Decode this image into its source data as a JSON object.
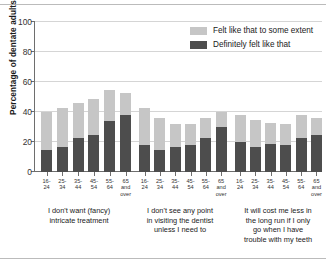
{
  "chart_data": {
    "type": "bar",
    "title": "",
    "subtitle": "",
    "xlabel": "",
    "ylabel": "Percentage of dentate adults",
    "ylim": [
      0,
      100
    ],
    "yticks": [
      0,
      20,
      40,
      60,
      80,
      100
    ],
    "ytick_labels": [
      "0",
      "20",
      "40",
      "60",
      "80",
      "100"
    ],
    "grid": true,
    "stacked": true,
    "legend_position": "top-right",
    "legend": [
      {
        "name": "Felt like that to some extent",
        "color": "#c6c6c6"
      },
      {
        "name": "Definitely felt like that",
        "color": "#4d4d4d"
      }
    ],
    "categories": [
      "16-24",
      "25-34",
      "35-44",
      "45-54",
      "55-64",
      "65 and over"
    ],
    "category_lines": [
      [
        "16-",
        "24"
      ],
      [
        "25-",
        "34"
      ],
      [
        "35-",
        "44"
      ],
      [
        "45-",
        "54"
      ],
      [
        "55-",
        "64"
      ],
      [
        "65",
        "and",
        "over"
      ]
    ],
    "groups": [
      {
        "label": "I don't want (fancy) intricate treatment",
        "label_lines": [
          "I don't want (fancy)",
          "intricate treatment"
        ],
        "series": [
          {
            "name": "Definitely felt like that",
            "values": [
              15,
              17,
              23,
              25,
              34,
              38
            ]
          },
          {
            "name": "Felt like that to some extent",
            "values": [
              25,
              26,
              23,
              24,
              21,
              15
            ]
          }
        ],
        "totals": [
          40,
          43,
          46,
          49,
          55,
          53
        ]
      },
      {
        "label": "I don't see any point in visiting the dentist unless I need to",
        "label_lines": [
          "I don't see any point",
          "in visiting the dentist",
          "unless I need to"
        ],
        "series": [
          {
            "name": "Definitely felt like that",
            "values": [
              18,
              15,
              17,
              18,
              23,
              30
            ]
          },
          {
            "name": "Felt like that to some extent",
            "values": [
              25,
              21,
              15,
              14,
              13,
              10
            ]
          }
        ],
        "totals": [
          43,
          36,
          32,
          32,
          36,
          40
        ]
      },
      {
        "label": "It will cost me less in the long run if I only go when I have trouble with my teeth",
        "label_lines": [
          "It will cost me less in",
          "the long run if I only",
          "go when I have",
          "trouble with my teeth"
        ],
        "series": [
          {
            "name": "Definitely felt like that",
            "values": [
              20,
              17,
              19,
              18,
              23,
              25
            ]
          },
          {
            "name": "Felt like that to some extent",
            "values": [
              18,
              18,
              14,
              14,
              15,
              11
            ]
          }
        ],
        "totals": [
          38,
          35,
          33,
          32,
          38,
          36
        ]
      }
    ]
  },
  "colors": {
    "some_extent": "#c6c6c6",
    "definitely": "#4d4d4d",
    "axis": "#6e6e6e",
    "grid": "#d5d5d5",
    "background": "#ffffff"
  }
}
